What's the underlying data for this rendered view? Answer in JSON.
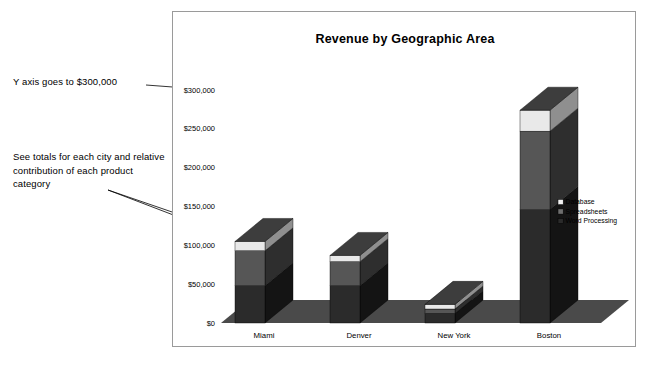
{
  "chart_data": {
    "type": "bar",
    "subtype": "stacked-3d-column",
    "title": "Revenue by Geographic Area",
    "xlabel": "",
    "ylabel": "",
    "categories": [
      "Miami",
      "Denver",
      "New York",
      "Boston"
    ],
    "series": [
      {
        "name": "Word Processing",
        "color": "#2b2b2b",
        "values": [
          48000,
          48000,
          12000,
          146000
        ]
      },
      {
        "name": "Spreadsheets",
        "color": "#565656",
        "values": [
          45000,
          31000,
          6000,
          101000
        ]
      },
      {
        "name": "Database",
        "color": "#e9e9e9",
        "values": [
          12000,
          8000,
          6000,
          27000
        ]
      }
    ],
    "totals": [
      105000,
      87000,
      24000,
      274000
    ],
    "ylim": [
      0,
      300000
    ],
    "ytick_values": [
      0,
      50000,
      100000,
      150000,
      200000,
      250000,
      300000
    ],
    "ytick_labels": [
      "$0",
      "$50,000",
      "$100,000",
      "$150,000",
      "$200,000",
      "$250,000",
      "$300,000"
    ],
    "grid": false,
    "legend_position": "right"
  },
  "legend": {
    "items": [
      {
        "label": "Database",
        "swatch": "#f2f2f2"
      },
      {
        "label": "Spreadsheets",
        "swatch": "#6e6e6e"
      },
      {
        "label": "Word Processing",
        "swatch": "#2b2b2b"
      }
    ]
  },
  "annotations": {
    "y_axis_note": "Y axis goes to $300,000",
    "totals_note": "See totals for each city and relative contribution of each product category"
  },
  "colors": {
    "frame_border": "#9a9a9a",
    "floor": "#4a4a4a",
    "bar_front_dark": "#2b2b2b",
    "bar_front_mid": "#565656",
    "bar_front_light": "#e9e9e9",
    "bar_side_dark": "#141414",
    "bar_side_mid": "#2e2e2e",
    "bar_side_light": "#8f8f8f",
    "bar_top_dark": "#3d3d3d",
    "bar_top_light": "#fbfbfb"
  }
}
